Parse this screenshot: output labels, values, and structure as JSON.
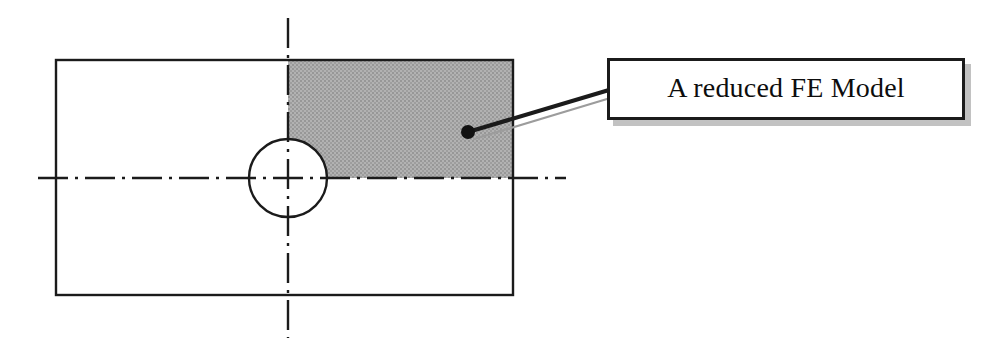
{
  "figure": {
    "type": "engineering-diagram",
    "background_color": "#ffffff"
  },
  "callout": {
    "label": "A reduced FE Model",
    "border_color": "#1b1b1b",
    "fill_color": "#ffffff",
    "shadow_color": "#8f8f8f",
    "text_color": "#0d0d0d"
  },
  "geometry": {
    "plate": {
      "name": "plate-outline",
      "x": 56,
      "y": 60,
      "width": 457,
      "height": 235,
      "stroke_color": "#1b1b1b",
      "fill": "none"
    },
    "shaded_quadrant": {
      "name": "reduced-model-region",
      "x": 288,
      "y": 60,
      "width": 225,
      "height": 118,
      "fill_color": "#ababab",
      "note": "upper-right quadrant, shaded"
    },
    "hole": {
      "name": "center-hole",
      "cx": 288,
      "cy": 178,
      "r": 39,
      "stroke_color": "#1b1b1b",
      "fill_color": "#ffffff"
    },
    "vertical_centerline": {
      "name": "vertical-centerline",
      "x": 288,
      "y1": 18,
      "y2": 338,
      "style": "dash-dot",
      "color": "#1b1b1b"
    },
    "horizontal_centerline": {
      "name": "horizontal-centerline",
      "y": 178,
      "x1": 38,
      "x2": 566,
      "style": "dash-dot",
      "color": "#1b1b1b"
    },
    "leader": {
      "name": "callout-leader-line",
      "anchor_dot": {
        "cx": 468,
        "cy": 132,
        "r": 6,
        "color": "#111111"
      },
      "line_from": {
        "x": 468,
        "y": 132
      },
      "line_to": {
        "x": 607,
        "y": 90
      },
      "color": "#1b1b1b",
      "shadow_line_color": "#9c9c9c"
    }
  }
}
